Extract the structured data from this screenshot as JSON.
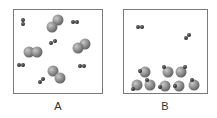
{
  "figure": {
    "panels": [
      {
        "id": "A",
        "label": "A",
        "description": "Gas mixture: large diatomic molecules and small diatomic molecules dispersed"
      },
      {
        "id": "B",
        "label": "B",
        "description": "Two small diatomic molecules in gas phase; large atoms with small atoms attached clustered at the bottom"
      }
    ]
  },
  "colors": {
    "large_atom": "#8a8a8a",
    "small_atom": "#2e2e2e",
    "border": "#7a7a7a"
  }
}
